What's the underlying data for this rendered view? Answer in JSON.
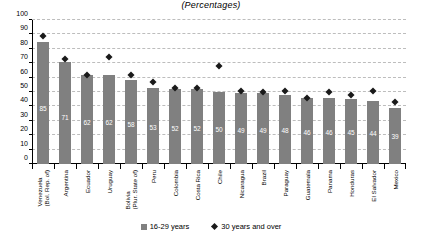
{
  "chart_data": {
    "type": "bar",
    "title": "(Percentages)",
    "xlabel": "",
    "ylabel": "",
    "ylim": [
      0,
      100
    ],
    "ytick_step": 10,
    "yticks": [
      100,
      90,
      80,
      70,
      60,
      50,
      40,
      30,
      20,
      10,
      0
    ],
    "grid": true,
    "legend_position": "bottom",
    "categories": [
      "Venezuela (Bol. Rep. of)",
      "Argentina",
      "Ecuador",
      "Uruguay",
      "Bolivia (Plur. State of)",
      "Peru",
      "Colombia",
      "Costa Rica",
      "Chile",
      "Nicaragua",
      "Brazil",
      "Paraguay",
      "Guatemala",
      "Panama",
      "Honduras",
      "El Salvador",
      "Mexico"
    ],
    "category_lines": [
      [
        "Venezuela",
        "(Bol. Rep. of)"
      ],
      [
        "Argentina"
      ],
      [
        "Ecuador"
      ],
      [
        "Uruguay"
      ],
      [
        "Bolivia",
        "(Plur. State of)"
      ],
      [
        "Peru"
      ],
      [
        "Colombia"
      ],
      [
        "Costa Rica"
      ],
      [
        "Chile"
      ],
      [
        "Nicaragua"
      ],
      [
        "Brazil"
      ],
      [
        "Paraguay"
      ],
      [
        "Guatemala"
      ],
      [
        "Panama"
      ],
      [
        "Honduras"
      ],
      [
        "El Salvador"
      ],
      [
        "Mexico"
      ]
    ],
    "series": [
      {
        "name": "16-29 years",
        "type": "bar",
        "color": "#808080",
        "values": [
          85,
          71,
          62,
          62,
          58,
          53,
          52,
          52,
          50,
          49,
          49,
          48,
          46,
          46,
          45,
          44,
          39
        ],
        "labels": [
          "85",
          "71",
          "62",
          "62",
          "58",
          "53",
          "52",
          "52",
          "50",
          "49",
          "49",
          "48",
          "46",
          "46",
          "45",
          "44",
          "39"
        ]
      },
      {
        "name": "30 years and over",
        "type": "scatter",
        "marker": "diamond",
        "color": "#1a1a1a",
        "values": [
          89,
          73,
          62,
          74,
          62,
          57,
          53,
          53,
          68,
          51,
          50,
          51,
          46,
          50,
          48,
          51,
          43
        ]
      }
    ]
  },
  "legend": {
    "items": [
      {
        "label": "16-29 years",
        "marker": "square"
      },
      {
        "label": "30 years and over",
        "marker": "diamond"
      }
    ]
  }
}
